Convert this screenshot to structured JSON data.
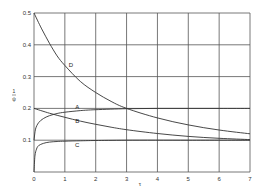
{
  "chart_data": {
    "type": "line",
    "title": "",
    "xlabel": "τ",
    "ylabel": "ψ/ε",
    "xlim": [
      0,
      7
    ],
    "ylim": [
      0,
      0.5
    ],
    "grid": true,
    "legend": "inline curve labels",
    "x_ticks": [
      "0",
      "1",
      "2",
      "3",
      "4",
      "5",
      "6",
      "7"
    ],
    "y_ticks": [
      "0",
      "0.1",
      "0.2",
      "0.3",
      "0.4",
      "0.5"
    ],
    "series": [
      {
        "name": "D",
        "x": [
          0,
          0.25,
          0.5,
          0.75,
          1,
          1.5,
          2,
          2.5,
          3,
          4,
          5,
          6,
          7
        ],
        "values": [
          0.5,
          0.45,
          0.405,
          0.365,
          0.335,
          0.285,
          0.25,
          0.222,
          0.2,
          0.17,
          0.148,
          0.132,
          0.12
        ]
      },
      {
        "name": "A",
        "x": [
          0,
          0.05,
          0.15,
          0.3,
          0.5,
          0.75,
          1,
          1.5,
          2,
          3,
          4,
          5,
          6,
          7
        ],
        "values": [
          0.1,
          0.135,
          0.155,
          0.168,
          0.177,
          0.184,
          0.188,
          0.193,
          0.196,
          0.199,
          0.2,
          0.2,
          0.2,
          0.2
        ]
      },
      {
        "name": "B",
        "x": [
          0,
          0.5,
          1,
          1.5,
          2,
          2.5,
          3,
          4,
          5,
          6,
          7
        ],
        "values": [
          0.2,
          0.185,
          0.172,
          0.16,
          0.15,
          0.141,
          0.133,
          0.121,
          0.112,
          0.106,
          0.102
        ]
      },
      {
        "name": "C",
        "x": [
          0,
          0.03,
          0.08,
          0.15,
          0.3,
          0.5,
          0.75,
          1,
          1.5,
          2,
          3,
          5,
          7
        ],
        "values": [
          0,
          0.05,
          0.072,
          0.083,
          0.09,
          0.094,
          0.096,
          0.097,
          0.098,
          0.099,
          0.1,
          0.1,
          0.1
        ]
      }
    ],
    "labels": [
      {
        "text": "D",
        "x": 1.2,
        "y": 0.335
      },
      {
        "text": "A",
        "x": 1.4,
        "y": 0.205
      },
      {
        "text": "B",
        "x": 1.4,
        "y": 0.16
      },
      {
        "text": "C",
        "x": 1.4,
        "y": 0.085
      }
    ]
  }
}
